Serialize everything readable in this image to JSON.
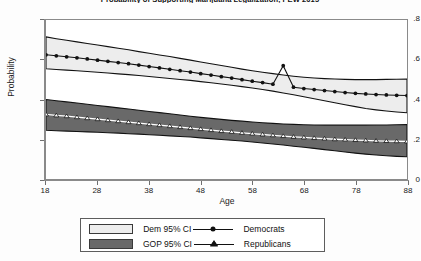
{
  "chart_data": {
    "type": "line",
    "title": "Probability of Supporting Marijuana Legalization, PEW 2015",
    "xlabel": "Age",
    "ylabel": "Probability",
    "xlim": [
      18,
      88
    ],
    "ylim": [
      0,
      0.8
    ],
    "xticks": [
      "18",
      "28",
      "38",
      "48",
      "58",
      "68",
      "78",
      "88"
    ],
    "xtick_values": [
      18,
      28,
      38,
      48,
      58,
      68,
      78,
      88
    ],
    "yticks": [
      "0",
      ".2",
      ".4",
      ".6",
      ".8"
    ],
    "ytick_values": [
      0,
      0.2,
      0.4,
      0.6,
      0.8
    ],
    "grid": false,
    "legend_position": "below-plot",
    "x": [
      18,
      20,
      22,
      24,
      26,
      28,
      30,
      32,
      34,
      36,
      38,
      40,
      42,
      44,
      46,
      48,
      50,
      52,
      54,
      56,
      58,
      60,
      62,
      64,
      66,
      68,
      70,
      72,
      74,
      76,
      78,
      80,
      82,
      84,
      86,
      88
    ],
    "series": [
      {
        "name": "Democrats",
        "marker": "filled-circle",
        "color": "#111111",
        "values": [
          0.625,
          0.62,
          0.615,
          0.61,
          0.604,
          0.598,
          0.592,
          0.586,
          0.58,
          0.573,
          0.566,
          0.559,
          0.552,
          0.545,
          0.538,
          0.53,
          0.523,
          0.515,
          0.508,
          0.5,
          0.492,
          0.485,
          0.477,
          0.57,
          0.462,
          0.455,
          0.45,
          0.445,
          0.44,
          0.435,
          0.431,
          0.428,
          0.425,
          0.423,
          0.421,
          0.42
        ]
      },
      {
        "name": "Republicans",
        "marker": "hollow-triangle",
        "color": "#ffffff",
        "values": [
          0.325,
          0.32,
          0.316,
          0.311,
          0.306,
          0.301,
          0.296,
          0.291,
          0.286,
          0.281,
          0.276,
          0.271,
          0.266,
          0.261,
          0.256,
          0.251,
          0.246,
          0.241,
          0.237,
          0.232,
          0.228,
          0.224,
          0.22,
          0.216,
          0.212,
          0.209,
          0.206,
          0.203,
          0.2,
          0.198,
          0.196,
          0.194,
          0.192,
          0.191,
          0.19,
          0.189
        ]
      }
    ],
    "bands": [
      {
        "name": "Dem 95% CI",
        "fill": "#ededed",
        "upper": [
          0.715,
          0.706,
          0.698,
          0.69,
          0.682,
          0.674,
          0.666,
          0.658,
          0.65,
          0.641,
          0.633,
          0.624,
          0.616,
          0.607,
          0.598,
          0.589,
          0.58,
          0.571,
          0.562,
          0.553,
          0.545,
          0.537,
          0.53,
          0.523,
          0.517,
          0.512,
          0.508,
          0.505,
          0.503,
          0.501,
          0.5,
          0.5,
          0.5,
          0.501,
          0.502,
          0.503
        ],
        "lower": [
          0.555,
          0.551,
          0.548,
          0.545,
          0.541,
          0.537,
          0.533,
          0.529,
          0.525,
          0.521,
          0.516,
          0.511,
          0.506,
          0.501,
          0.496,
          0.49,
          0.484,
          0.478,
          0.472,
          0.465,
          0.458,
          0.45,
          0.442,
          0.433,
          0.424,
          0.414,
          0.404,
          0.394,
          0.384,
          0.374,
          0.364,
          0.355,
          0.348,
          0.342,
          0.337,
          0.333
        ]
      },
      {
        "name": "GOP 95% CI",
        "fill": "#696969",
        "upper": [
          0.4,
          0.394,
          0.388,
          0.382,
          0.376,
          0.37,
          0.364,
          0.358,
          0.352,
          0.346,
          0.34,
          0.334,
          0.328,
          0.322,
          0.316,
          0.31,
          0.305,
          0.3,
          0.295,
          0.291,
          0.287,
          0.283,
          0.28,
          0.277,
          0.275,
          0.273,
          0.272,
          0.271,
          0.271,
          0.271,
          0.271,
          0.271,
          0.272,
          0.272,
          0.273,
          0.274
        ],
        "lower": [
          0.245,
          0.243,
          0.241,
          0.239,
          0.237,
          0.235,
          0.233,
          0.231,
          0.228,
          0.226,
          0.223,
          0.22,
          0.217,
          0.214,
          0.211,
          0.207,
          0.203,
          0.199,
          0.195,
          0.191,
          0.186,
          0.181,
          0.176,
          0.171,
          0.165,
          0.16,
          0.154,
          0.148,
          0.142,
          0.136,
          0.13,
          0.125,
          0.121,
          0.117,
          0.114,
          0.112
        ]
      }
    ]
  },
  "legend": {
    "items": [
      {
        "label": "Dem 95% CI",
        "swatch": "dem"
      },
      {
        "label": "GOP 95% CI",
        "swatch": "gop"
      }
    ],
    "lines": [
      {
        "label": "Democrats",
        "marker": "filled-circle"
      },
      {
        "label": "Republicans",
        "marker": "hollow-triangle"
      }
    ]
  }
}
